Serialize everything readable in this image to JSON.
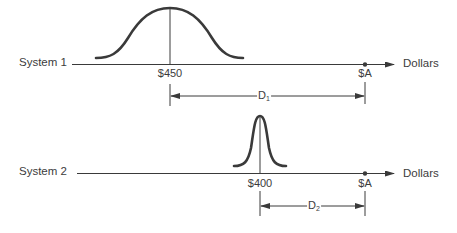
{
  "colors": {
    "ink": "#3a3a3a",
    "background": "#ffffff"
  },
  "systems": [
    {
      "label": "System 1",
      "mean_label": "$450",
      "target_label": "$A",
      "axis_unit": "Dollars",
      "distance_label": "D",
      "distance_subscript": "1",
      "distribution": "wide"
    },
    {
      "label": "System 2",
      "mean_label": "$400",
      "target_label": "$A",
      "axis_unit": "Dollars",
      "distance_label": "D",
      "distance_subscript": "2",
      "distribution": "narrow"
    }
  ]
}
